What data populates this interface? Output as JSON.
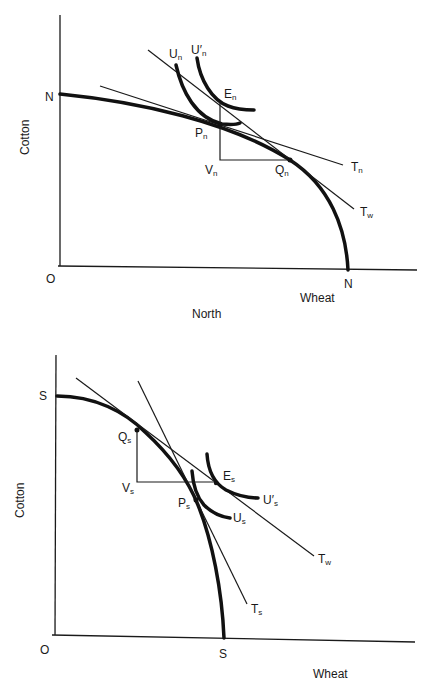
{
  "panels": {
    "north": {
      "caption": "North",
      "y_axis_label": "Cotton",
      "x_axis_label": "Wheat",
      "origin_label": "O",
      "ppf_intercept_y": "N",
      "ppf_intercept_x": "N",
      "points": {
        "E": {
          "main": "E",
          "sub": "n"
        },
        "P": {
          "main": "P",
          "sub": "n"
        },
        "V": {
          "main": "V",
          "sub": "n"
        },
        "Q": {
          "main": "Q",
          "sub": "n"
        }
      },
      "curves": {
        "U": {
          "main": "U",
          "sub": "n"
        },
        "U_prime": {
          "main": "U′",
          "sub": "n"
        }
      },
      "lines": {
        "T_home": {
          "main": "T",
          "sub": "n"
        },
        "T_world": {
          "main": "T",
          "sub": "w"
        }
      }
    },
    "south": {
      "y_axis_label": "Cotton",
      "x_axis_label": "Wheat",
      "origin_label": "O",
      "ppf_intercept_y": "S",
      "ppf_intercept_x": "S",
      "points": {
        "E": {
          "main": "E",
          "sub": "s"
        },
        "P": {
          "main": "P",
          "sub": "s"
        },
        "V": {
          "main": "V",
          "sub": "s"
        },
        "Q": {
          "main": "Q",
          "sub": "s"
        }
      },
      "curves": {
        "U": {
          "main": "U",
          "sub": "s"
        },
        "U_prime": {
          "main": "U′",
          "sub": "s"
        }
      },
      "lines": {
        "T_home": {
          "main": "T",
          "sub": "s"
        },
        "T_world": {
          "main": "T",
          "sub": "w"
        }
      }
    }
  }
}
